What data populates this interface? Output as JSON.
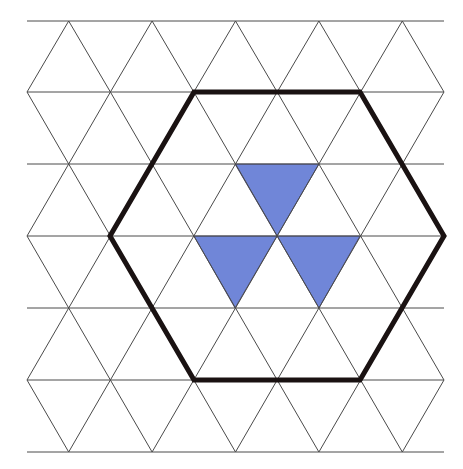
{
  "diagram": {
    "type": "triangular-grid",
    "background_color": "#ffffff",
    "grid": {
      "line_color": "#4a4a4a",
      "rows": 6,
      "row_y": [
        21,
        92,
        164,
        236,
        308,
        380,
        452
      ],
      "left_x": 27,
      "right_x": 444,
      "half_side": 41.7
    },
    "hexagon": {
      "stroke_color": "#1a1212",
      "vertices": [
        [
          194,
          92
        ],
        [
          360,
          92
        ],
        [
          444,
          236
        ],
        [
          360,
          380
        ],
        [
          194,
          380
        ],
        [
          110,
          236
        ]
      ]
    },
    "shaded_triangles": {
      "fill_color": "#7086d8",
      "items": [
        {
          "name": "shaded-triangle-top",
          "points": [
            [
              235,
              164
            ],
            [
              319,
              164
            ],
            [
              277,
              236
            ]
          ]
        },
        {
          "name": "shaded-triangle-bottom-left",
          "points": [
            [
              194,
              236
            ],
            [
              277,
              236
            ],
            [
              235,
              308
            ]
          ]
        },
        {
          "name": "shaded-triangle-bottom-right",
          "points": [
            [
              277,
              236
            ],
            [
              360,
              236
            ],
            [
              319,
              308
            ]
          ]
        }
      ]
    }
  }
}
